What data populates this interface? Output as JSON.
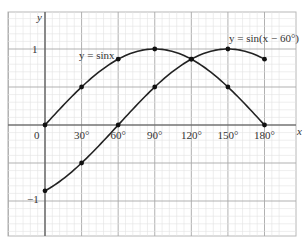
{
  "chart_data": {
    "type": "line",
    "title": "",
    "xlabel": "x",
    "ylabel": "y",
    "xlim": [
      -27,
      192
    ],
    "ylim": [
      -1.5,
      1.5
    ],
    "grid": true,
    "x_ticks": [
      "0",
      "30°",
      "60°",
      "90°",
      "120°",
      "150°",
      "180°"
    ],
    "y_ticks": [
      "1",
      "-1"
    ],
    "series": [
      {
        "name": "y = sinx",
        "x": [
          0,
          30,
          60,
          90,
          120,
          150,
          180
        ],
        "values": [
          0,
          0.5,
          0.866,
          1,
          0.866,
          0.5,
          0
        ]
      },
      {
        "name": "y = sin(x − 60°)",
        "x": [
          0,
          30,
          60,
          90,
          120,
          150,
          180
        ],
        "values": [
          -0.866,
          -0.5,
          0,
          0.5,
          0.866,
          1,
          0.866
        ]
      }
    ],
    "annotations": [
      "y = sinx",
      "y = sin(x − 60°)"
    ]
  },
  "labels": {
    "y_axis": "y",
    "x_axis": "x",
    "origin": "0",
    "y_one": "1",
    "y_minus_one": "−1",
    "series1": "y = sinx",
    "series2": "y = sin(x − 60°)"
  }
}
